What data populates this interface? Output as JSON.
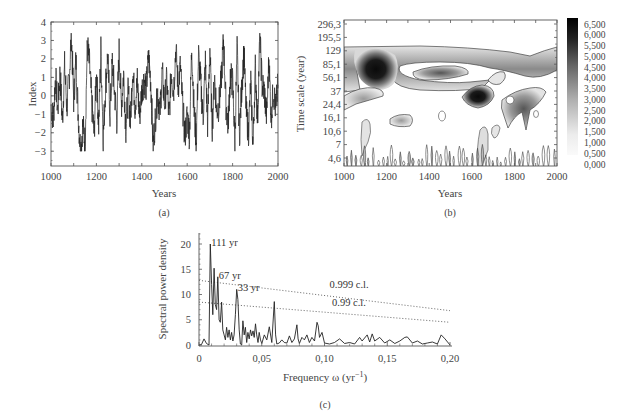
{
  "chart_data": [
    {
      "id": "a",
      "type": "line",
      "caption": "(a)",
      "title": "",
      "xlabel": "Years",
      "ylabel": "Index",
      "xlim": [
        1000,
        2000
      ],
      "ylim": [
        -3.8,
        4
      ],
      "xticks": [
        1000,
        1200,
        1400,
        1600,
        1800,
        2000
      ],
      "yticks": [
        4,
        3,
        2,
        1,
        0,
        -1,
        -2,
        -3
      ],
      "grid": false,
      "series": [
        {
          "name": "Index",
          "x": [
            1000,
            1010,
            1020,
            1030,
            1040,
            1050,
            1060,
            1070,
            1080,
            1090,
            1100,
            1110,
            1120,
            1130,
            1140,
            1150,
            1160,
            1170,
            1180,
            1190,
            1200,
            1210,
            1220,
            1230,
            1240,
            1250,
            1260,
            1270,
            1280,
            1290,
            1300,
            1310,
            1320,
            1330,
            1340,
            1350,
            1360,
            1370,
            1380,
            1390,
            1400,
            1410,
            1420,
            1430,
            1440,
            1450,
            1460,
            1470,
            1480,
            1490,
            1500,
            1510,
            1520,
            1530,
            1540,
            1550,
            1560,
            1570,
            1580,
            1590,
            1600,
            1610,
            1620,
            1630,
            1640,
            1650,
            1660,
            1670,
            1680,
            1690,
            1700,
            1710,
            1720,
            1730,
            1740,
            1750,
            1760,
            1770,
            1780,
            1790,
            1800,
            1810,
            1820,
            1830,
            1840,
            1850,
            1860,
            1870,
            1880,
            1890,
            1900,
            1910,
            1920,
            1930,
            1940,
            1950,
            1960,
            1970,
            1980,
            1990,
            2000
          ],
          "values": [
            -0.5,
            -1.3,
            1.1,
            -0.8,
            1.3,
            -1.4,
            1.6,
            -0.6,
            1.0,
            3.3,
            -0.2,
            1.9,
            -1.0,
            -3.0,
            -1.6,
            -2.5,
            2.8,
            1.6,
            -0.5,
            -2.1,
            1.4,
            -1.6,
            2.5,
            -2.3,
            0.5,
            2.2,
            -1.0,
            1.8,
            0.2,
            -1.3,
            2.4,
            -0.5,
            1.2,
            -1.8,
            0.3,
            -1.4,
            1.5,
            -0.6,
            0.8,
            -1.1,
            0.3,
            0.9,
            0.5,
            2.1,
            0.7,
            -2.7,
            -1.2,
            0.2,
            -0.9,
            1.3,
            -0.4,
            0.8,
            -1.3,
            1.4,
            0.2,
            2.6,
            0.5,
            1.6,
            -0.6,
            -2.2,
            -1.0,
            -2.1,
            2.7,
            -0.8,
            -2.4,
            2.2,
            0.6,
            -1.2,
            1.8,
            -1.5,
            2.6,
            -1.8,
            1.1,
            -0.8,
            -0.5,
            0.9,
            3.0,
            -0.3,
            -1.6,
            1.1,
            0.7,
            -2.4,
            2.6,
            -2.2,
            0.4,
            2.4,
            -0.9,
            -2.0,
            0.8,
            -2.7,
            1.5,
            -1.3,
            3.3,
            0.6,
            0.2,
            -1.1,
            2.0,
            -1.2,
            0.4,
            -0.8,
            0.6
          ]
        }
      ]
    },
    {
      "id": "b",
      "type": "heatmap",
      "caption": "(b)",
      "title": "",
      "xlabel": "Years",
      "ylabel": "Time scale (year)",
      "xlim": [
        1000,
        2000
      ],
      "xticks": [
        1000,
        1200,
        1400,
        1600,
        1800,
        2000
      ],
      "yticks": [
        "296,3",
        "195,5",
        "129",
        "85,1",
        "56,1",
        "37",
        "24,4",
        "16,1",
        "10,6",
        "7",
        "4,6"
      ],
      "y_scale": "log",
      "colorbar": {
        "ticks": [
          "6,500",
          "6,000",
          "5,500",
          "5,000",
          "4,500",
          "4,000",
          "3,500",
          "3,000",
          "2,500",
          "2,000",
          "1,500",
          "1,000",
          "0,500",
          "0,000"
        ],
        "range": [
          0,
          6.5
        ],
        "cmap": "greys"
      },
      "regions": [
        {
          "label": "band ~85-129 yr, 1000-2000",
          "center": [
            1500,
            100
          ],
          "peak": 3.0
        },
        {
          "label": "max ~1100-1200, ~70-110 yr",
          "center": [
            1150,
            85
          ],
          "peak": 6.5
        },
        {
          "label": "~1640, ~35 yr",
          "center": [
            1640,
            35
          ],
          "peak": 6.0
        },
        {
          "label": "~1830, ~30 yr",
          "center": [
            1830,
            30
          ],
          "peak": 3.5
        },
        {
          "label": "~1450, ~60 yr",
          "center": [
            1450,
            60
          ],
          "peak": 2.5
        },
        {
          "label": "~1270, ~18 yr",
          "center": [
            1270,
            18
          ],
          "peak": 1.5
        }
      ]
    },
    {
      "id": "c",
      "type": "line",
      "caption": "(c)",
      "title": "",
      "xlabel": "Frequency ω (yr⁻¹)",
      "ylabel": "Spectral power density",
      "xlim": [
        0,
        0.2
      ],
      "ylim": [
        0,
        22
      ],
      "xticks": [
        "0",
        "0,05",
        "0,10",
        "0,15",
        "0,20"
      ],
      "yticks": [
        0,
        5,
        10,
        15,
        20
      ],
      "grid": false,
      "annotations": [
        {
          "text": "111 yr",
          "x": 0.009,
          "y": 20
        },
        {
          "text": "67 yr",
          "x": 0.015,
          "y": 13.5
        },
        {
          "text": "33 yr",
          "x": 0.03,
          "y": 11
        }
      ],
      "series": [
        {
          "name": "Spectrum",
          "x": [
            0,
            0.002,
            0.004,
            0.006,
            0.008,
            0.009,
            0.01,
            0.011,
            0.012,
            0.013,
            0.014,
            0.015,
            0.016,
            0.017,
            0.018,
            0.019,
            0.02,
            0.021,
            0.022,
            0.023,
            0.024,
            0.025,
            0.026,
            0.027,
            0.028,
            0.029,
            0.03,
            0.031,
            0.032,
            0.033,
            0.034,
            0.035,
            0.036,
            0.037,
            0.038,
            0.039,
            0.04,
            0.041,
            0.042,
            0.043,
            0.044,
            0.045,
            0.046,
            0.047,
            0.048,
            0.049,
            0.05,
            0.052,
            0.054,
            0.056,
            0.058,
            0.06,
            0.061,
            0.062,
            0.064,
            0.066,
            0.068,
            0.07,
            0.072,
            0.074,
            0.076,
            0.078,
            0.079,
            0.08,
            0.082,
            0.084,
            0.086,
            0.088,
            0.09,
            0.092,
            0.094,
            0.095,
            0.096,
            0.098,
            0.1,
            0.104,
            0.108,
            0.112,
            0.116,
            0.12,
            0.124,
            0.128,
            0.13,
            0.134,
            0.136,
            0.138,
            0.14,
            0.144,
            0.148,
            0.152,
            0.156,
            0.16,
            0.164,
            0.166,
            0.17,
            0.174,
            0.178,
            0.182,
            0.186,
            0.19,
            0.193,
            0.196,
            0.2
          ],
          "values": [
            0,
            0.1,
            1.2,
            0.3,
            0,
            20,
            12,
            6,
            15.2,
            8,
            7,
            13.5,
            5,
            4.5,
            8.5,
            3,
            2,
            1,
            3.5,
            1.5,
            3,
            1,
            2.5,
            0.8,
            2,
            6,
            11,
            9,
            3,
            0.2,
            0,
            4.8,
            2,
            3.5,
            0.5,
            2.5,
            1.2,
            3,
            1.8,
            2.8,
            1.5,
            4.2,
            2,
            0.5,
            2.5,
            1,
            0.3,
            2,
            1,
            3.6,
            0.5,
            8.6,
            2,
            0.2,
            0.4,
            1,
            0.5,
            0.4,
            1.8,
            0.5,
            1.2,
            4,
            1.2,
            0.3,
            1.5,
            1,
            2,
            0.5,
            1.5,
            0.8,
            4.5,
            3.8,
            1.5,
            2.5,
            0.4,
            0.2,
            0.5,
            1.2,
            0.3,
            0.5,
            0.2,
            1.5,
            0.8,
            2,
            0.6,
            2.2,
            0.8,
            1.5,
            0.4,
            1,
            0.3,
            0.8,
            1.5,
            1.6,
            0.4,
            0.8,
            0.2,
            0.4,
            0.6,
            0.2,
            2,
            1.2,
            0
          ]
        },
        {
          "name": "0.999 c.l.",
          "x": [
            0,
            0.2
          ],
          "values": [
            12.8,
            6.8
          ],
          "style": "dotted"
        },
        {
          "name": "0.99 c.l.",
          "x": [
            0,
            0.2
          ],
          "values": [
            8.5,
            4.5
          ],
          "style": "dotted"
        }
      ],
      "line_labels": [
        {
          "text": "0.999 c.l.",
          "x": 0.104,
          "y": 11.2
        },
        {
          "text": "0.99 c.l.",
          "x": 0.106,
          "y": 7.8
        }
      ]
    }
  ]
}
